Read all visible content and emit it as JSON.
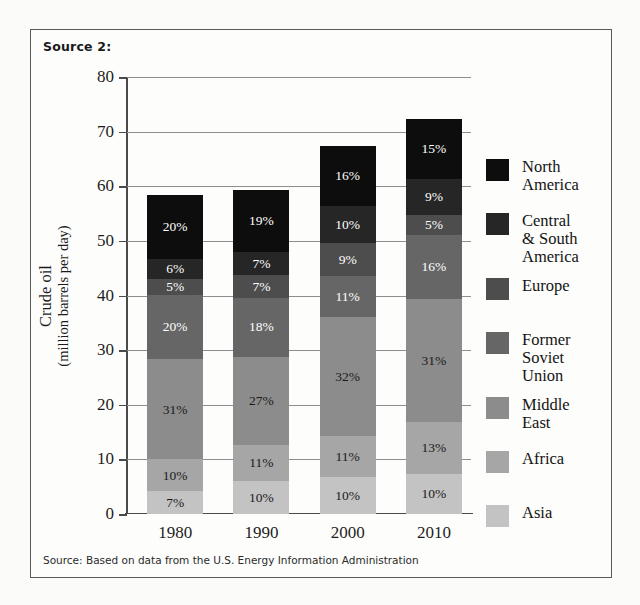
{
  "header": {
    "source_label": "Source 2:"
  },
  "footer": {
    "note": "Source: Based on data from the U.S. Energy Information Administration"
  },
  "chart_data": {
    "type": "bar",
    "stacked": true,
    "title": "",
    "xlabel": "",
    "ylabel": "Crude oil",
    "ylabel_sub": "(million barrels per day)",
    "ylim": [
      0,
      80
    ],
    "yticks": [
      0,
      10,
      20,
      30,
      40,
      50,
      60,
      70,
      80
    ],
    "ytick_labels": [
      "0",
      "10",
      "20",
      "30",
      "40",
      "50",
      "60",
      "70",
      "80"
    ],
    "grid": true,
    "legend_position": "right",
    "categories": [
      "1980",
      "1990",
      "2000",
      "2010"
    ],
    "totals": [
      59,
      60,
      68,
      73
    ],
    "value_unit": "%",
    "series": [
      {
        "name": "Asia",
        "color": "#c3c3c3",
        "text_on_dark": false,
        "values": [
          7,
          10,
          10,
          10
        ],
        "labels": [
          "7%",
          "10%",
          "10%",
          "10%"
        ]
      },
      {
        "name": "Africa",
        "color": "#a6a6a6",
        "text_on_dark": false,
        "values": [
          10,
          11,
          11,
          13
        ],
        "labels": [
          "10%",
          "11%",
          "11%",
          "13%"
        ]
      },
      {
        "name": "Middle East",
        "color": "#8c8c8c",
        "text_on_dark": false,
        "values": [
          31,
          27,
          32,
          31
        ],
        "labels": [
          "31%",
          "27%",
          "32%",
          "31%"
        ]
      },
      {
        "name": "Former Soviet\nUnion",
        "color": "#666666",
        "text_on_dark": true,
        "values": [
          20,
          18,
          11,
          16
        ],
        "labels": [
          "20%",
          "18%",
          "11%",
          "16%"
        ]
      },
      {
        "name": "Europe",
        "color": "#4d4d4d",
        "text_on_dark": true,
        "values": [
          5,
          7,
          9,
          5
        ],
        "labels": [
          "5%",
          "7%",
          "9%",
          "5%"
        ]
      },
      {
        "name": "Central & South\nAmerica",
        "color": "#262626",
        "text_on_dark": true,
        "values": [
          6,
          7,
          10,
          9
        ],
        "labels": [
          "6%",
          "7%",
          "10%",
          "9%"
        ]
      },
      {
        "name": "North America",
        "color": "#0d0d0d",
        "text_on_dark": true,
        "values": [
          20,
          19,
          16,
          15
        ],
        "labels": [
          "20%",
          "19%",
          "16%",
          "15%"
        ]
      }
    ]
  }
}
